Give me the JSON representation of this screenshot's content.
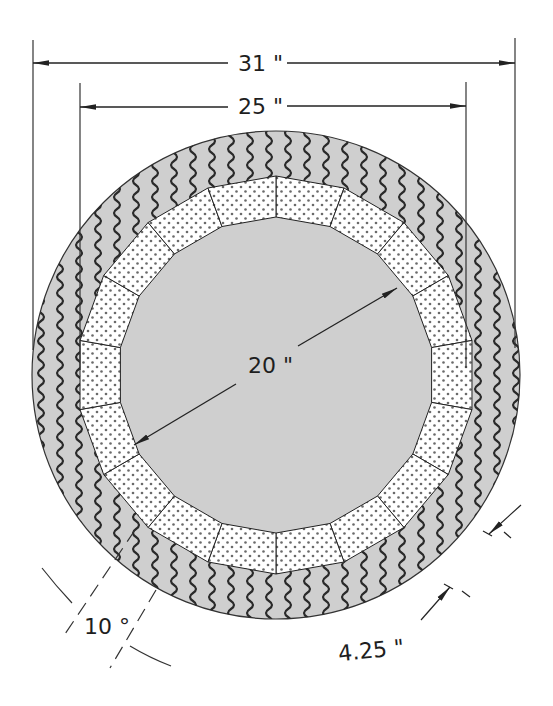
{
  "diagram": {
    "colors": {
      "outer_ring_fill": "#cfcfcf",
      "wave_stroke": "#2a2a2a",
      "block_fill": "#ffffff",
      "dot_fill": "#6a6a6a",
      "line": "#222222"
    },
    "geometry": {
      "center": [
        276,
        375
      ],
      "outer_radius": 244,
      "blocks_outer_radius": 199,
      "blocks_inner_radius": 158,
      "block_count": 18
    },
    "dimensions": {
      "overall_width": "31 \"",
      "inner_width": "25 \"",
      "inner_diameter": "20 \"",
      "ring_thickness": "4.25 \"",
      "block_angle": "10 °"
    },
    "layers": [
      {
        "name": "outer-ring",
        "pattern": "wavy",
        "label": "outer wavy layer"
      },
      {
        "name": "segment-blocks",
        "pattern": "dotted",
        "label": "dotted segmented blocks"
      },
      {
        "name": "bore",
        "pattern": "none",
        "label": "open interior"
      }
    ]
  }
}
